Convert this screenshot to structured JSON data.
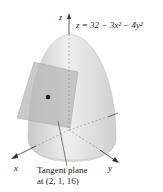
{
  "figure": {
    "equation": "z = 32 − 3x² − 4y²",
    "axes": {
      "x_label": "x",
      "y_label": "y",
      "z_label": "z"
    },
    "caption_line1": "Tangent plane",
    "caption_line2": "at (2, 1, 16)",
    "point": {
      "x": 2,
      "y": 1,
      "z": 16
    },
    "colors": {
      "surface": "#d6d6d6",
      "plane": "#bdbdbd",
      "point": "#000000",
      "axes": "#333333"
    }
  }
}
